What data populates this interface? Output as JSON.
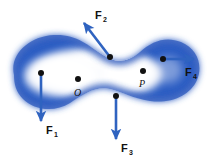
{
  "figure": {
    "background_color": "#ffffff",
    "body": {
      "name": "rigid-body-blob",
      "shape": "kidney-bean",
      "edge_color": "#2f5fc4",
      "mid_color": "#6f9de0",
      "center_color": "#ffffff"
    },
    "arrow_color": "#2f63c0",
    "dot_color": "#111111"
  },
  "forces": [
    {
      "id": "F1",
      "letter": "F",
      "subscript": "1",
      "direction": "down",
      "tail": {
        "x": 41,
        "y": 73
      },
      "head": {
        "x": 41,
        "y": 126
      },
      "label_x": 46,
      "label_y": 133
    },
    {
      "id": "F2",
      "letter": "F",
      "subscript": "2",
      "direction": "up-left",
      "tail": {
        "x": 110,
        "y": 57
      },
      "head": {
        "x": 81,
        "y": 19
      },
      "label_x": 95,
      "label_y": 18
    },
    {
      "id": "F3",
      "letter": "F",
      "subscript": "3",
      "direction": "down",
      "tail": {
        "x": 116,
        "y": 96
      },
      "head": {
        "x": 116,
        "y": 144
      },
      "label_x": 121,
      "label_y": 151
    },
    {
      "id": "F4",
      "letter": "F",
      "subscript": "4",
      "direction": "right",
      "tail": {
        "x": 163,
        "y": 59
      },
      "head": {
        "x": 199,
        "y": 59
      },
      "label_x": 186,
      "label_y": 75
    }
  ],
  "points": [
    {
      "id": "O",
      "label": "O",
      "dot_x": 78,
      "dot_y": 79,
      "label_x": 74,
      "label_y": 95,
      "description": "reference point inside body"
    },
    {
      "id": "P",
      "label": "P",
      "dot_x": 143,
      "dot_y": 71,
      "label_x": 139,
      "label_y": 86,
      "description": "point near right side of body"
    }
  ]
}
